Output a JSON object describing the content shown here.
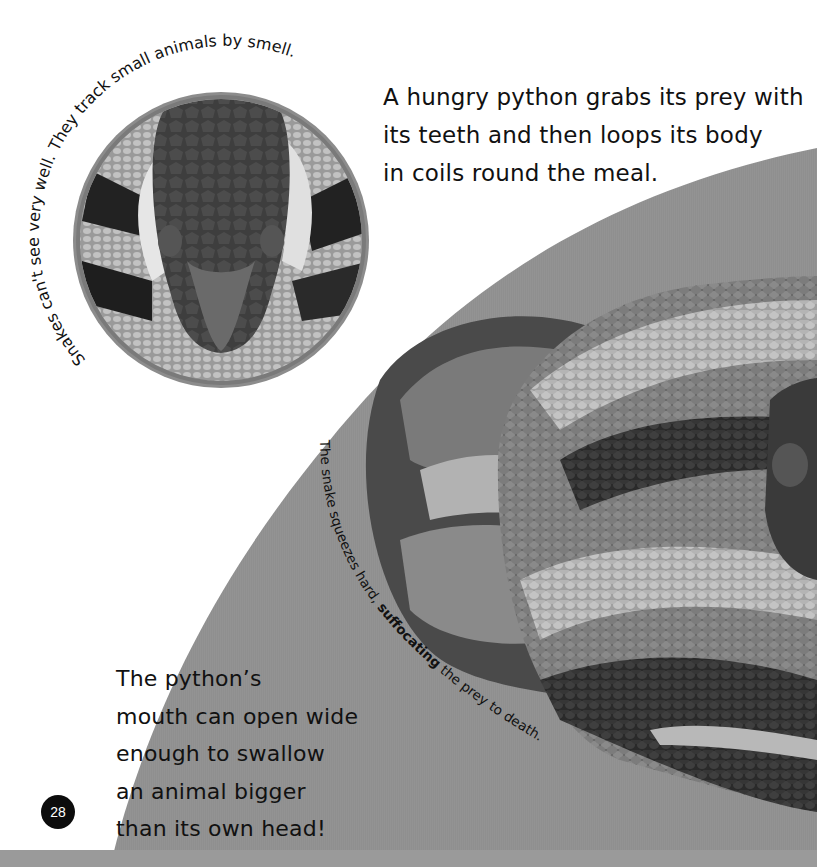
{
  "page": {
    "number": "28",
    "intro_paragraph": [
      "A hungry python grabs its prey with",
      "its teeth and then loops its body",
      "in coils round the meal."
    ],
    "inset_caption": "Snakes can't see very well. They track small animals by smell.",
    "squeeze_caption": {
      "part1": "The snake squeezes hard, ",
      "bold": "suffocating",
      "part2": " the prey to death."
    },
    "fact_paragraph": [
      "The python’s",
      "mouth can open wide",
      "enough to swallow",
      "an animal bigger",
      "than its own head!"
    ]
  },
  "images": {
    "inset": "python-head-closeup",
    "main": "coiled-python"
  },
  "colors": {
    "background": "#ffffff",
    "grey_panel": "#8e8e8e",
    "text": "#111111",
    "page_badge": "#0c0c0c"
  }
}
